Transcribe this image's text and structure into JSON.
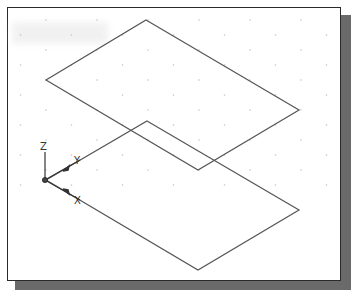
{
  "viewport": {
    "background": "#ffffff",
    "border_color": "#2a2a2a",
    "shadow_color": "#6a6a6a",
    "grid_dot_color": "#c4c4c4",
    "line_color": "#555555"
  },
  "ucs_icon": {
    "z_label": "Z",
    "y_label": "Y",
    "x_label": "X"
  },
  "objects": [
    {
      "name": "upper-rectangle",
      "vertices": [
        [
          146,
          20
        ],
        [
          299,
          110
        ],
        [
          198,
          170
        ],
        [
          46,
          80
        ]
      ]
    },
    {
      "name": "lower-rectangle",
      "vertices": [
        [
          147,
          121
        ],
        [
          299,
          210
        ],
        [
          198,
          270
        ],
        [
          46,
          180
        ]
      ]
    }
  ]
}
